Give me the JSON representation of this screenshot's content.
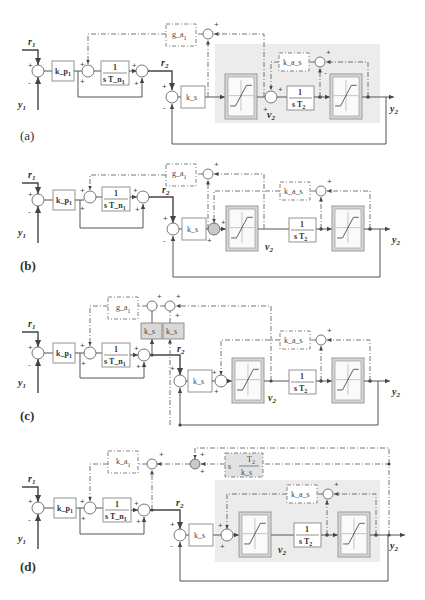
{
  "figure": {
    "panels": [
      {
        "id": "a",
        "label": "(a)"
      },
      {
        "id": "b",
        "label": "(b)"
      },
      {
        "id": "c",
        "label": "(c)"
      },
      {
        "id": "d",
        "label": "(d)"
      }
    ],
    "signals": {
      "r1": "r",
      "r1_sub": "1",
      "y1": "y",
      "y1_sub": "1",
      "r2": "r",
      "r2_sub": "2",
      "v2": "v",
      "v2_sub": "2",
      "y2": "y",
      "y2_sub": "2"
    },
    "blocks": {
      "kp1": "k_p",
      "kp1_sub": "1",
      "integrator1_num": "1",
      "integrator1_den": "s T_n",
      "integrator1_den_sub": "1",
      "ks": "k_s",
      "integrator2_num": "1",
      "integrator2_den": "s T",
      "integrator2_den_sub": "2",
      "ga1": "g_a",
      "ga1_sub": "1",
      "ka1": "k_a",
      "ka1_sub": "1",
      "kas": "k_a_s",
      "ks_grey": "k_s",
      "deriv_s": "s",
      "deriv_num": "T",
      "deriv_num_sub": "2",
      "deriv_den": "k_s"
    },
    "signs": {
      "plus": "+",
      "minus": "-"
    }
  }
}
